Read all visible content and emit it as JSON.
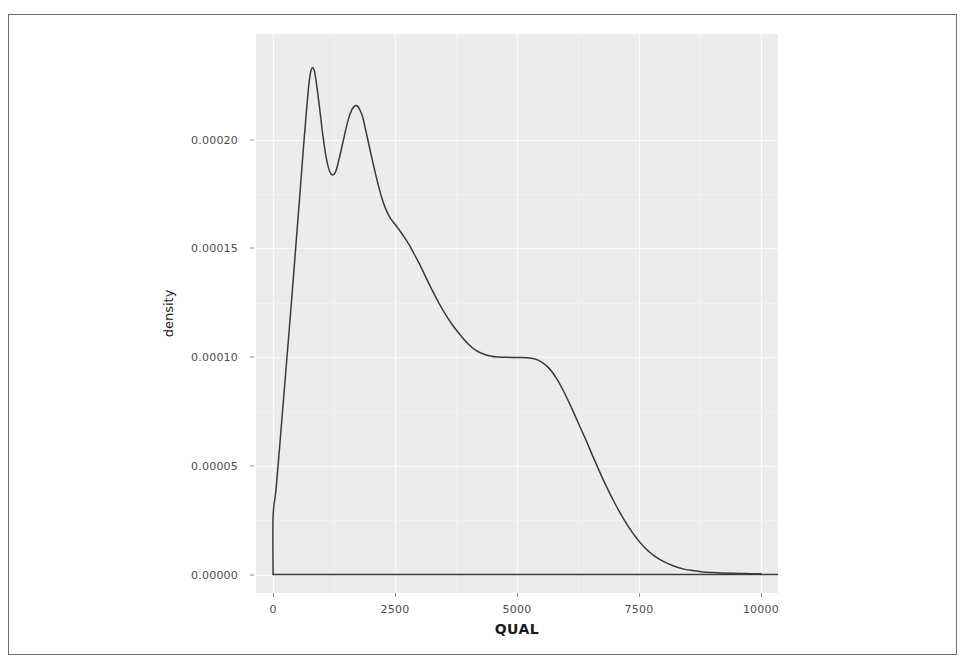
{
  "figure": {
    "panel_background": "#ececec",
    "line_color": "#3a3a3a",
    "tick_color": "#4d4d4d",
    "frame_color": "#6f6f6f"
  },
  "chart_data": {
    "type": "line",
    "title": "",
    "subtitle": "",
    "xlabel": "QUAL",
    "ylabel": "density",
    "xlim": [
      -350,
      10350
    ],
    "ylim": [
      -8.5e-06,
      0.0002485
    ],
    "grid": true,
    "legend": null,
    "x_ticks": [
      0,
      2500,
      5000,
      7500,
      10000
    ],
    "x_tick_labels": [
      "0",
      "2500",
      "5000",
      "7500",
      "10000"
    ],
    "y_ticks": [
      0.0,
      5e-05,
      0.0001,
      0.00015,
      0.0002
    ],
    "y_tick_labels": [
      "0.00000",
      "0.00005",
      "0.00010",
      "0.00015",
      "0.00020"
    ],
    "series": [
      {
        "name": "density",
        "x": [
          0,
          0,
          60,
          130,
          210,
          300,
          390,
          470,
          550,
          620,
          680,
          730,
          770,
          810,
          850,
          900,
          960,
          1020,
          1080,
          1140,
          1190,
          1240,
          1290,
          1340,
          1400,
          1470,
          1540,
          1610,
          1680,
          1740,
          1790,
          1840,
          1900,
          1970,
          2050,
          2130,
          2220,
          2310,
          2400,
          2500,
          2600,
          2700,
          2800,
          2900,
          3000,
          3120,
          3250,
          3400,
          3550,
          3700,
          3850,
          4000,
          4150,
          4300,
          4450,
          4600,
          4750,
          4900,
          5050,
          5200,
          5350,
          5500,
          5650,
          5800,
          5950,
          6100,
          6250,
          6400,
          6600,
          6800,
          7000,
          7200,
          7400,
          7600,
          7800,
          8000,
          8200,
          8400,
          8600,
          8800,
          9000,
          9200,
          9400,
          9600,
          9800,
          10000
        ],
        "y": [
          0.0,
          2.65e-05,
          3.9e-05,
          5.75e-05,
          7.95e-05,
          0.000104,
          0.000129,
          0.000152,
          0.000175,
          0.0001955,
          0.000212,
          0.0002245,
          0.000231,
          0.000233,
          0.0002312,
          0.000224,
          0.0002133,
          0.000202,
          0.0001928,
          0.0001866,
          0.0001841,
          0.0001838,
          0.0001856,
          0.0001898,
          0.0001955,
          0.0002025,
          0.000209,
          0.0002135,
          0.0002155,
          0.0002151,
          0.0002131,
          0.00021,
          0.0002042,
          0.000197,
          0.000189,
          0.0001814,
          0.0001738,
          0.000168,
          0.000164,
          0.000161,
          0.000158,
          0.0001548,
          0.0001512,
          0.000147,
          0.0001428,
          0.0001372,
          0.0001312,
          0.0001248,
          0.000119,
          0.000114,
          0.0001098,
          0.000106,
          0.0001032,
          0.0001015,
          0.0001005,
          0.0001,
          9.99e-05,
          9.98e-05,
          9.98e-05,
          9.97e-05,
          9.92e-05,
          9.78e-05,
          9.5e-05,
          9.05e-05,
          8.45e-05,
          7.75e-05,
          7e-05,
          6.25e-05,
          5.2e-05,
          4.2e-05,
          3.3e-05,
          2.5e-05,
          1.82e-05,
          1.28e-05,
          8.8e-06,
          6e-06,
          4e-06,
          2.6e-06,
          1.8e-06,
          1.2e-06,
          9e-07,
          7e-07,
          6e-07,
          5e-07,
          4e-07,
          3e-07
        ]
      }
    ]
  },
  "axes": {
    "y_title": "density",
    "x_title": "QUAL"
  }
}
